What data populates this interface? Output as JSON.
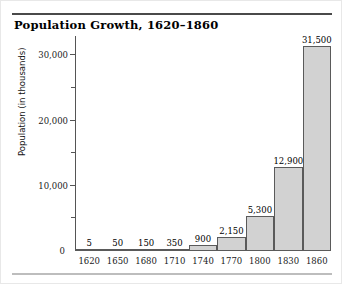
{
  "chart_data": {
    "type": "bar",
    "title": "Population Growth, 1620–1860",
    "xlabel": "",
    "ylabel": "Population (in thousands)",
    "categories": [
      "1620",
      "1650",
      "1680",
      "1710",
      "1740",
      "1770",
      "1800",
      "1830",
      "1860"
    ],
    "values": [
      5,
      50,
      150,
      350,
      900,
      2150,
      5300,
      12900,
      31500
    ],
    "value_labels": [
      "5",
      "50",
      "150",
      "350",
      "900",
      "2,150",
      "5,300",
      "12,900",
      "31,500"
    ],
    "ylim": [
      0,
      32500
    ],
    "y_major_ticks": [
      0,
      10000,
      20000,
      30000
    ],
    "y_major_tick_labels": [
      "0",
      "10,000",
      "20,000",
      "30,000"
    ],
    "y_minor_ticks": [
      5000,
      15000,
      25000
    ],
    "grid": false,
    "legend": null,
    "bar_fill_color": "#d2d2d2",
    "bar_edge_color": "#5a5a5a",
    "axis_color": "#555555",
    "background_color": "#ffffff"
  },
  "figure": {
    "title": "Population Growth, 1620–1860",
    "zero_label": "0"
  }
}
